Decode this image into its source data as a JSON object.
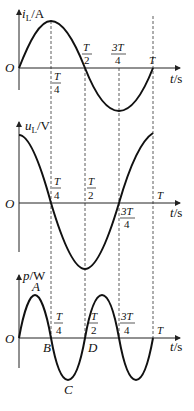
{
  "diagram": {
    "colors": {
      "curve": "#111111",
      "axis": "#222222",
      "dashed": "#333333",
      "background": "#ffffff"
    },
    "origin_label": "O",
    "x_axis_label": {
      "var": "t",
      "unit": "/s"
    },
    "ticks": {
      "quarter": {
        "num": "T",
        "den": "4"
      },
      "half": {
        "num": "T",
        "den": "2"
      },
      "three_quarter": {
        "num": "3T",
        "den": "4"
      },
      "full": "T"
    },
    "plots": [
      {
        "id": "current",
        "y_label": {
          "var": "i",
          "sub": "L",
          "unit": "/A"
        },
        "function": "sin"
      },
      {
        "id": "voltage",
        "y_label": {
          "var": "u",
          "sub": "L",
          "unit": "/V"
        },
        "function": "cos"
      },
      {
        "id": "power",
        "y_label": {
          "var": "p",
          "unit": "/W"
        },
        "function": "sin(2x)",
        "points": {
          "A": "A",
          "B": "B",
          "C": "C",
          "D": "D"
        }
      }
    ]
  }
}
